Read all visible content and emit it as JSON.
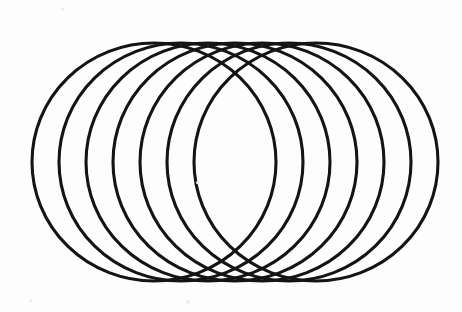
{
  "figure": {
    "kind": "line-drawing",
    "background_color": "#fdfdfd",
    "stroke_color": "#141414",
    "stroke_width": 3.1,
    "canvas": {
      "width": 462,
      "height": 312
    },
    "ellipse_count": 7,
    "geometry": {
      "rx": 122,
      "ry": 119,
      "cy": 162,
      "cx_first": 154,
      "cx_last": 316,
      "cx_step": 27,
      "left_extent": 32,
      "right_extent": 438,
      "top_extent": 43,
      "bottom_extent": 281
    },
    "ellipses": [
      {
        "id": "ellipse-1",
        "cx": 154,
        "cy": 162,
        "rx": 122,
        "ry": 119
      },
      {
        "id": "ellipse-2",
        "cx": 181,
        "cy": 162,
        "rx": 122,
        "ry": 119
      },
      {
        "id": "ellipse-3",
        "cx": 208,
        "cy": 162,
        "rx": 122,
        "ry": 119
      },
      {
        "id": "ellipse-4",
        "cx": 235,
        "cy": 162,
        "rx": 122,
        "ry": 119
      },
      {
        "id": "ellipse-5",
        "cx": 262,
        "cy": 162,
        "rx": 122,
        "ry": 119
      },
      {
        "id": "ellipse-6",
        "cx": 289,
        "cy": 162,
        "rx": 122,
        "ry": 119
      },
      {
        "id": "ellipse-7",
        "cx": 316,
        "cy": 162,
        "rx": 122,
        "ry": 119
      }
    ],
    "specks": [
      {
        "id": "speck-1",
        "x": 61,
        "y": 8,
        "size": 3
      },
      {
        "id": "speck-2",
        "x": 186,
        "y": 300,
        "size": 4
      },
      {
        "id": "speck-3",
        "x": 29,
        "y": 299,
        "size": 3
      },
      {
        "id": "speck-4",
        "x": 196,
        "y": 181,
        "size": 3
      }
    ]
  }
}
